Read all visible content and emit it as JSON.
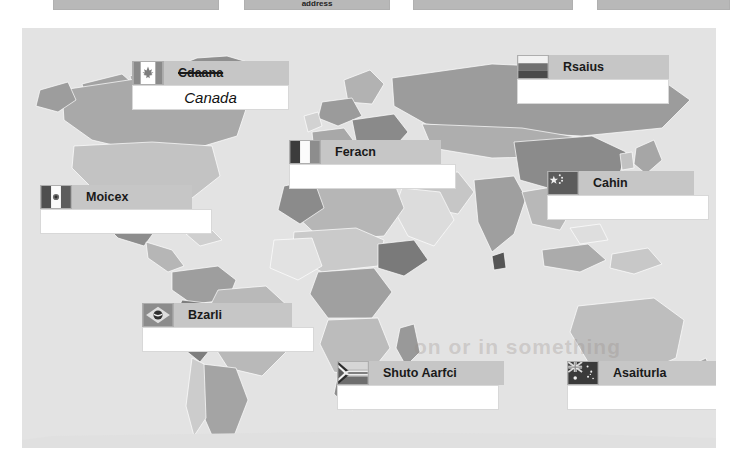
{
  "toolbar": {
    "cells": [
      {
        "label": ""
      },
      {
        "label": "address"
      },
      {
        "label": ""
      },
      {
        "label": ""
      }
    ]
  },
  "slide": {
    "background_color": "#e3e3e3",
    "watermark": "on or in something"
  },
  "map": {
    "type": "world-map-grayscale",
    "ocean_color": "#e3e3e3",
    "country_colors": [
      "#9a9a9a",
      "#b4b4b4",
      "#cfcfcf",
      "#848484",
      "#6f6f6f",
      "#e8e8e8",
      "#a8a8a8",
      "#bdbdbd"
    ]
  },
  "countries": [
    {
      "id": "canada",
      "flag": "canada-flag",
      "label": "Cdaana",
      "struck": true,
      "answer": "Canada",
      "x": 110,
      "y": 33,
      "label_width": 125,
      "answer_width": 125
    },
    {
      "id": "russia",
      "flag": "russia-flag",
      "label": "Rsaius",
      "struck": false,
      "answer": "",
      "x": 495,
      "y": 27,
      "label_width": 120,
      "answer_width": 120
    },
    {
      "id": "france",
      "flag": "france-flag",
      "label": "Feracn",
      "struck": false,
      "answer": "",
      "x": 267,
      "y": 112,
      "label_width": 120,
      "answer_width": 135
    },
    {
      "id": "china",
      "flag": "china-flag",
      "label": "Cahin",
      "struck": false,
      "answer": "",
      "x": 525,
      "y": 143,
      "label_width": 115,
      "answer_width": 130
    },
    {
      "id": "mexico",
      "flag": "mexico-flag",
      "label": "Moicex",
      "struck": false,
      "answer": "",
      "x": 18,
      "y": 157,
      "label_width": 120,
      "answer_width": 140
    },
    {
      "id": "brazil",
      "flag": "brazil-flag",
      "label": "Bzarli",
      "struck": false,
      "answer": "",
      "x": 120,
      "y": 275,
      "label_width": 118,
      "answer_width": 140
    },
    {
      "id": "south-africa",
      "flag": "south-africa-flag",
      "label": "Shuto Aarfci",
      "struck": false,
      "answer": "",
      "x": 315,
      "y": 333,
      "label_width": 135,
      "answer_width": 130
    },
    {
      "id": "australia",
      "flag": "australia-flag",
      "label": "Asaiturla",
      "struck": false,
      "answer": "",
      "x": 545,
      "y": 333,
      "label_width": 128,
      "answer_width": 128
    }
  ]
}
